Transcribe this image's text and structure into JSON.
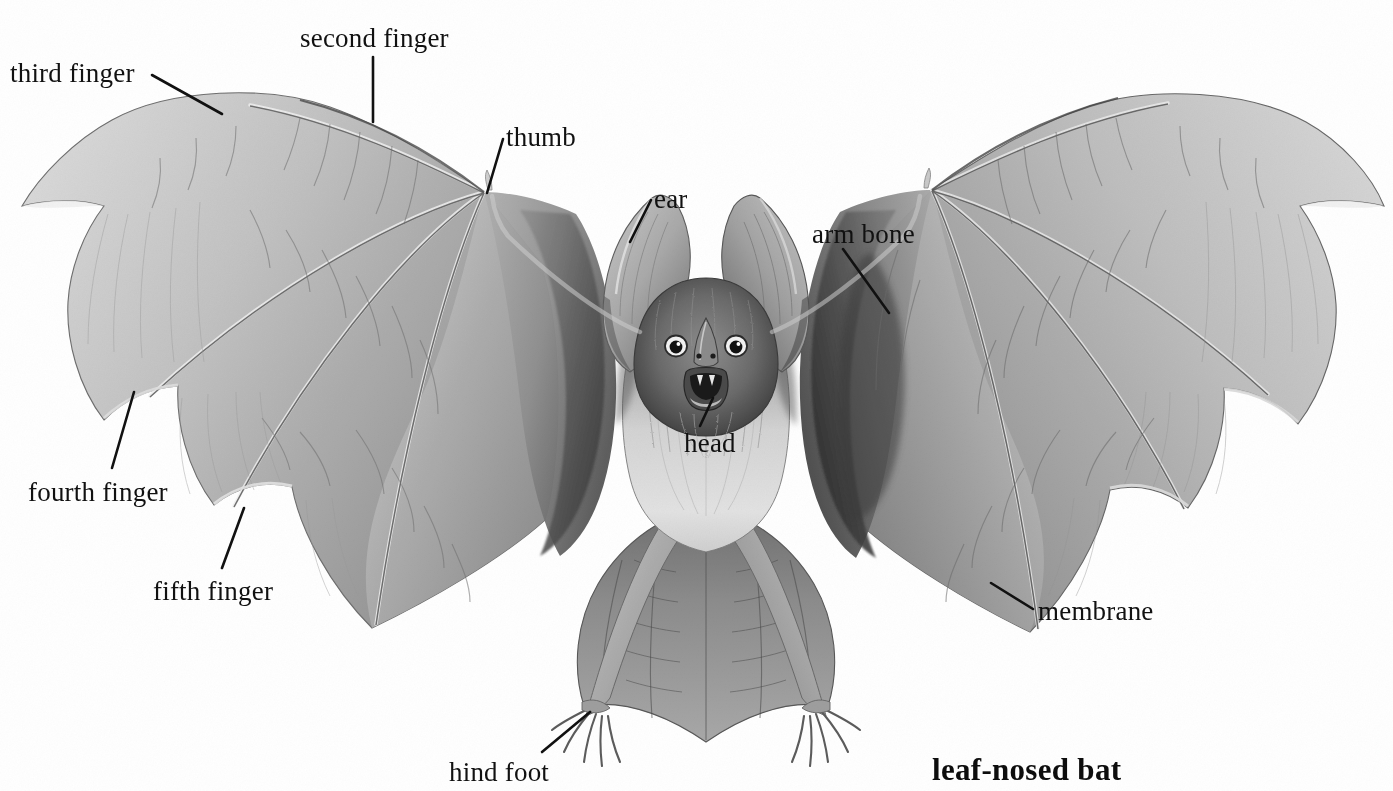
{
  "figure": {
    "subject": "leaf-nosed bat",
    "title": "leaf-nosed bat",
    "background_color": "#ffffff",
    "ink_color": "#111111",
    "style": "grayscale pencil / airbrush natural-history illustration",
    "width": 1393,
    "height": 791
  },
  "labels": [
    {
      "id": "third-finger",
      "text": "third finger",
      "x": 10,
      "y": 60
    },
    {
      "id": "second-finger",
      "text": "second finger",
      "x": 300,
      "y": 25
    },
    {
      "id": "thumb",
      "text": "thumb",
      "x": 506,
      "y": 124
    },
    {
      "id": "ear",
      "text": "ear",
      "x": 654,
      "y": 186
    },
    {
      "id": "arm-bone",
      "text": "arm bone",
      "x": 812,
      "y": 221
    },
    {
      "id": "head",
      "text": "head",
      "x": 684,
      "y": 430
    },
    {
      "id": "membrane",
      "text": "membrane",
      "x": 1038,
      "y": 598
    },
    {
      "id": "fourth-finger",
      "text": "fourth finger",
      "x": 28,
      "y": 479
    },
    {
      "id": "fifth-finger",
      "text": "fifth finger",
      "x": 153,
      "y": 578
    },
    {
      "id": "hind-foot",
      "text": "hind foot",
      "x": 449,
      "y": 759
    }
  ],
  "leader_lines": [
    {
      "id": "leader-third-finger",
      "x1": 152,
      "y1": 75,
      "x2": 222,
      "y2": 114
    },
    {
      "id": "leader-second-finger",
      "x1": 373,
      "y1": 57,
      "x2": 373,
      "y2": 122
    },
    {
      "id": "leader-thumb",
      "x1": 503,
      "y1": 139,
      "x2": 487,
      "y2": 193
    },
    {
      "id": "leader-ear",
      "x1": 651,
      "y1": 200,
      "x2": 630,
      "y2": 242
    },
    {
      "id": "leader-arm-bone",
      "x1": 843,
      "y1": 249,
      "x2": 889,
      "y2": 313
    },
    {
      "id": "leader-head",
      "x1": 713,
      "y1": 398,
      "x2": 700,
      "y2": 426
    },
    {
      "id": "leader-membrane",
      "x1": 1033,
      "y1": 609,
      "x2": 991,
      "y2": 583
    },
    {
      "id": "leader-fourth-finger",
      "x1": 112,
      "y1": 468,
      "x2": 134,
      "y2": 392
    },
    {
      "id": "leader-fifth-finger",
      "x1": 222,
      "y1": 568,
      "x2": 244,
      "y2": 508
    },
    {
      "id": "leader-hind-foot",
      "x1": 542,
      "y1": 752,
      "x2": 590,
      "y2": 712
    }
  ],
  "title_position": {
    "x": 932,
    "y": 752
  }
}
